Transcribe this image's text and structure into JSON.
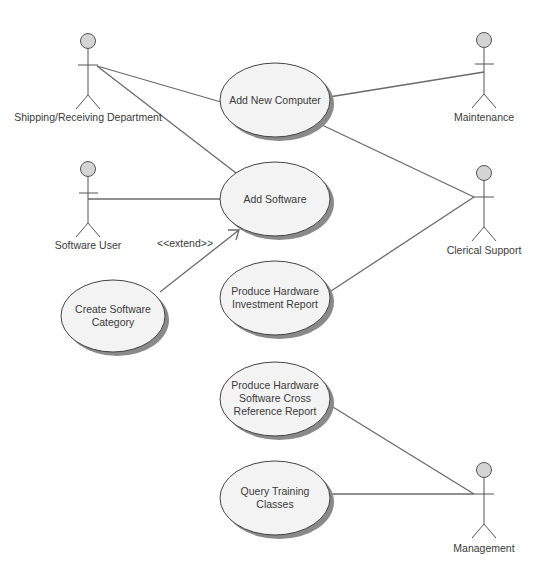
{
  "diagram": {
    "type": "uml-use-case",
    "colors": {
      "background": "#ffffff",
      "ellipse_fill": "#f3f3f3",
      "ellipse_stroke": "#444444",
      "ellipse_shadow": "#8a8a8a",
      "actor_head_fill": "#d4d4d4",
      "line": "#6a6a6a",
      "text": "#3a3a3a"
    },
    "actors": [
      {
        "id": "shipping",
        "label": "Shipping/Receiving Department",
        "x": 88,
        "y": 41
      },
      {
        "id": "maintenance",
        "label": "Maintenance",
        "x": 484,
        "y": 40
      },
      {
        "id": "software-user",
        "label": "Software User",
        "x": 88,
        "y": 167
      },
      {
        "id": "clerical",
        "label": "Clerical Support",
        "x": 484,
        "y": 170
      },
      {
        "id": "management",
        "label": "Management",
        "x": 484,
        "y": 470
      }
    ],
    "use_cases": [
      {
        "id": "add-new-computer",
        "lines": [
          "Add New Computer"
        ],
        "cx": 275,
        "cy": 100
      },
      {
        "id": "add-software",
        "lines": [
          "Add Software"
        ],
        "cx": 275,
        "cy": 199
      },
      {
        "id": "create-software-category",
        "lines": [
          "Create Software",
          "Category"
        ],
        "cx": 113,
        "cy": 316
      },
      {
        "id": "produce-hw-investment",
        "lines": [
          "Produce Hardware",
          "Investment Report"
        ],
        "cx": 275,
        "cy": 298
      },
      {
        "id": "produce-hw-sw-crossref",
        "lines": [
          "Produce Hardware",
          "Software Cross",
          "Reference Report"
        ],
        "cx": 275,
        "cy": 399
      },
      {
        "id": "query-training",
        "lines": [
          "Query Training",
          "Classes"
        ],
        "cx": 275,
        "cy": 498
      }
    ],
    "associations": [
      {
        "from": "shipping",
        "to": "add-new-computer"
      },
      {
        "from": "shipping",
        "to": "add-software"
      },
      {
        "from": "maintenance",
        "to": "add-new-computer"
      },
      {
        "from": "software-user",
        "to": "add-software"
      },
      {
        "from": "clerical",
        "to": "add-new-computer"
      },
      {
        "from": "clerical",
        "to": "produce-hw-investment"
      },
      {
        "from": "management",
        "to": "produce-hw-sw-crossref"
      },
      {
        "from": "management",
        "to": "query-training"
      }
    ],
    "extends": [
      {
        "from": "create-software-category",
        "to": "add-software",
        "label": "<<extend>>"
      }
    ]
  }
}
